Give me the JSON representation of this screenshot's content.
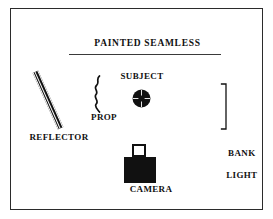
{
  "diagram": {
    "border_color": "#2b2b2b",
    "background_color": "#ffffff",
    "ink_color": "#111111",
    "labels": {
      "painted_seamless": "PAINTED SEAMLESS",
      "subject": "SUBJECT",
      "prop": "PROP",
      "reflector": "REFLECTOR",
      "bank_light_line1": "BANK",
      "bank_light_line2": "LIGHT",
      "camera": "CAMERA"
    },
    "elements": [
      {
        "name": "painted-seamless",
        "label": "PAINTED SEAMLESS",
        "icon": "horizontal-line-icon",
        "description": "Horizontal rule representing the painted seamless backdrop"
      },
      {
        "name": "reflector",
        "label": "REFLECTOR",
        "icon": "diagonal-bar-icon",
        "description": "Long thin bar angled toward the subject"
      },
      {
        "name": "prop",
        "label": "PROP",
        "icon": "squiggle-icon",
        "description": "Vertical wavy line standing beside the subject"
      },
      {
        "name": "subject",
        "label": "SUBJECT",
        "icon": "crosshair-circle-icon",
        "description": "Filled circle with crosshair at center of the set"
      },
      {
        "name": "bank-light",
        "label": "BANK LIGHT",
        "icon": "bracket-icon",
        "description": "Tall vertical bracket at the right of the set"
      },
      {
        "name": "camera",
        "label": "CAMERA",
        "icon": "camera-icon",
        "description": "Square lens atop a filled camera body"
      }
    ]
  }
}
